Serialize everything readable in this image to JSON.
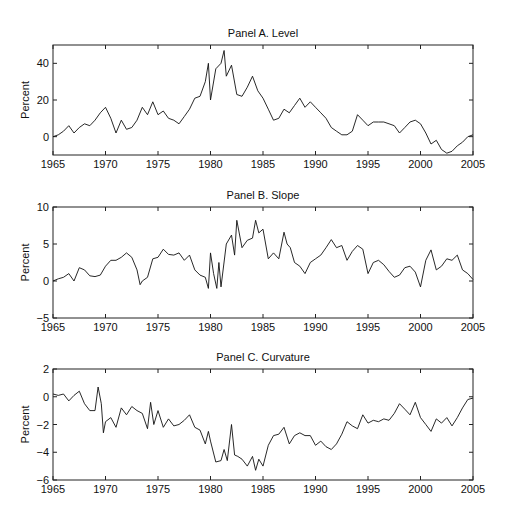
{
  "figure": {
    "width": 511,
    "height": 522,
    "line_color": "#111111",
    "frame_color": "#222222"
  },
  "chart_data": [
    {
      "type": "line",
      "title": "Panel A. Level",
      "xlabel": "",
      "ylabel": "Percent",
      "xlim": [
        1965,
        2005
      ],
      "ylim": [
        -10,
        50
      ],
      "xticks": [
        1965,
        1970,
        1975,
        1980,
        1985,
        1990,
        1995,
        2000,
        2005
      ],
      "yticks": [
        0,
        20,
        40
      ],
      "grid": false,
      "legend": null,
      "box": {
        "left": 53,
        "top": 45,
        "right": 473,
        "bottom": 155
      },
      "x": [
        1965,
        1965.5,
        1966,
        1966.5,
        1967,
        1967.5,
        1968,
        1968.5,
        1969,
        1969.5,
        1970,
        1970.5,
        1971,
        1971.5,
        1972,
        1972.5,
        1973,
        1973.5,
        1974,
        1974.5,
        1975,
        1975.5,
        1976,
        1976.5,
        1977,
        1977.5,
        1978,
        1978.5,
        1979,
        1979.5,
        1979.8,
        1980,
        1980.5,
        1981,
        1981.3,
        1981.5,
        1982,
        1982.5,
        1983,
        1983.5,
        1984,
        1984.5,
        1985,
        1985.5,
        1986,
        1986.5,
        1987,
        1987.5,
        1988,
        1988.5,
        1989,
        1989.5,
        1990,
        1990.5,
        1991,
        1991.5,
        1992,
        1992.5,
        1993,
        1993.5,
        1994,
        1994.5,
        1995,
        1995.5,
        1996,
        1996.5,
        1997,
        1997.5,
        1998,
        1998.5,
        1999,
        1999.5,
        2000,
        2000.5,
        2001,
        2001.5,
        2002,
        2002.5,
        2003,
        2003.5,
        2004,
        2004.5,
        2005
      ],
      "values": [
        0,
        1,
        3,
        6,
        2,
        5,
        7,
        6,
        9,
        13,
        16,
        10,
        2,
        9,
        4,
        5,
        9,
        16,
        12,
        19,
        12,
        14,
        10,
        9,
        7,
        11,
        15,
        21,
        22,
        30,
        40,
        20,
        37,
        40,
        47,
        33,
        39,
        23,
        22,
        27,
        33,
        25,
        21,
        15,
        9,
        10,
        15,
        13,
        17,
        21,
        16,
        19,
        16,
        13,
        10,
        5,
        3,
        1,
        1,
        3,
        12,
        9,
        6,
        8,
        8,
        8,
        7,
        6,
        2,
        5,
        8,
        9,
        7,
        2,
        -4,
        -2,
        -7,
        -9,
        -8,
        -5,
        -3,
        0,
        1
      ]
    },
    {
      "type": "line",
      "title": "Panel B. Slope",
      "xlabel": "",
      "ylabel": "Percent",
      "xlim": [
        1965,
        2005
      ],
      "ylim": [
        -5,
        10
      ],
      "xticks": [
        1965,
        1970,
        1975,
        1980,
        1985,
        1990,
        1995,
        2000,
        2005
      ],
      "yticks": [
        -5,
        0,
        5,
        10
      ],
      "grid": false,
      "legend": null,
      "box": {
        "left": 53,
        "top": 207,
        "right": 473,
        "bottom": 318
      },
      "x": [
        1965,
        1965.5,
        1966,
        1966.5,
        1967,
        1967.5,
        1968,
        1968.5,
        1969,
        1969.5,
        1970,
        1970.5,
        1971,
        1971.5,
        1972,
        1972.5,
        1973,
        1973.3,
        1973.5,
        1974,
        1974.5,
        1975,
        1975.5,
        1976,
        1976.5,
        1977,
        1977.5,
        1978,
        1978.5,
        1979,
        1979.5,
        1979.8,
        1980,
        1980.3,
        1980.6,
        1980.8,
        1981,
        1981.5,
        1982,
        1982.3,
        1982.5,
        1983,
        1983.5,
        1984,
        1984.3,
        1984.6,
        1985,
        1985.5,
        1986,
        1986.5,
        1987,
        1987.3,
        1987.6,
        1988,
        1988.5,
        1989,
        1989.5,
        1990,
        1990.5,
        1991,
        1991.5,
        1992,
        1992.5,
        1993,
        1993.5,
        1994,
        1994.5,
        1995,
        1995.5,
        1996,
        1996.5,
        1997,
        1997.5,
        1998,
        1998.5,
        1999,
        1999.5,
        2000,
        2000.5,
        2001,
        2001.5,
        2002,
        2002.5,
        2003,
        2003.5,
        2004,
        2004.5,
        2005
      ],
      "values": [
        0,
        0.3,
        0.5,
        1,
        0,
        1.8,
        1.5,
        0.7,
        0.6,
        0.8,
        2,
        2.8,
        2.8,
        3.2,
        3.8,
        3.2,
        1.5,
        -0.5,
        0,
        0.5,
        3,
        3.2,
        4.3,
        3.6,
        3.5,
        3.8,
        2.8,
        3.5,
        1.5,
        0.8,
        0.5,
        -1,
        3.8,
        1,
        -1,
        2.5,
        -0.8,
        5,
        6.2,
        3.5,
        8.2,
        4.5,
        5.5,
        5.8,
        8.2,
        6.5,
        7,
        3,
        3.8,
        3,
        6.6,
        5,
        4.5,
        2.5,
        2,
        1,
        2.5,
        3,
        3.5,
        4.5,
        5.6,
        4.5,
        4.8,
        2.8,
        4,
        4.8,
        4.3,
        1,
        2.5,
        2.8,
        2.2,
        1.3,
        0.5,
        0.8,
        1.8,
        2,
        1.2,
        -0.8,
        2.8,
        4.2,
        1.5,
        2,
        3,
        2.8,
        3.5,
        1.5,
        1,
        0.2
      ]
    },
    {
      "type": "line",
      "title": "Panel C. Curvature",
      "xlabel": "",
      "ylabel": "Percent",
      "xlim": [
        1965,
        2005
      ],
      "ylim": [
        -6,
        2
      ],
      "xticks": [
        1965,
        1970,
        1975,
        1980,
        1985,
        1990,
        1995,
        2000,
        2005
      ],
      "yticks": [
        -6,
        -4,
        -2,
        0,
        2
      ],
      "grid": false,
      "legend": null,
      "box": {
        "left": 53,
        "top": 369,
        "right": 473,
        "bottom": 480
      },
      "x": [
        1965,
        1965.5,
        1966,
        1966.5,
        1967,
        1967.5,
        1968,
        1968.5,
        1969,
        1969.3,
        1969.6,
        1969.8,
        1970,
        1970.5,
        1971,
        1971.5,
        1972,
        1972.5,
        1973,
        1973.5,
        1974,
        1974.3,
        1974.6,
        1975,
        1975.5,
        1976,
        1976.5,
        1977,
        1977.5,
        1978,
        1978.5,
        1979,
        1979.5,
        1979.8,
        1980,
        1980.5,
        1981,
        1981.3,
        1981.6,
        1982,
        1982.3,
        1982.6,
        1983,
        1983.5,
        1984,
        1984.3,
        1984.6,
        1985,
        1985.5,
        1986,
        1986.5,
        1987,
        1987.5,
        1988,
        1988.5,
        1989,
        1989.5,
        1990,
        1990.5,
        1991,
        1991.5,
        1992,
        1992.5,
        1993,
        1993.5,
        1994,
        1994.5,
        1995,
        1995.5,
        1996,
        1996.5,
        1997,
        1997.5,
        1998,
        1998.5,
        1999,
        1999.5,
        2000,
        2000.5,
        2001,
        2001.5,
        2002,
        2002.5,
        2003,
        2003.5,
        2004,
        2004.5,
        2005
      ],
      "values": [
        0.2,
        0.1,
        0.2,
        -0.3,
        0.1,
        0.4,
        -0.5,
        -1,
        -1,
        0.7,
        -0.5,
        -2.6,
        -1.8,
        -1.5,
        -2.2,
        -0.8,
        -1.3,
        -0.7,
        -1,
        -1.2,
        -2.3,
        -0.4,
        -2,
        -1,
        -2.2,
        -1.6,
        -2.1,
        -2,
        -1.7,
        -1.3,
        -2.2,
        -2.4,
        -3.4,
        -2.5,
        -3.2,
        -4.7,
        -4.6,
        -3.8,
        -4.6,
        -2,
        -4.2,
        -4.3,
        -4.5,
        -5,
        -4.3,
        -5.3,
        -4.5,
        -5,
        -3.5,
        -2.8,
        -2.7,
        -2.2,
        -3.4,
        -2.8,
        -2.6,
        -2.8,
        -2.8,
        -3.5,
        -3.2,
        -3.6,
        -3.8,
        -3.4,
        -2.7,
        -1.8,
        -2.1,
        -2.3,
        -1.3,
        -1.9,
        -1.7,
        -1.8,
        -1.6,
        -1.7,
        -1.2,
        -0.5,
        -0.9,
        -1.3,
        -0.4,
        -1.5,
        -2,
        -2.5,
        -1.6,
        -1.9,
        -1.5,
        -2.1,
        -1.5,
        -0.8,
        -0.2,
        -0.1
      ]
    }
  ]
}
